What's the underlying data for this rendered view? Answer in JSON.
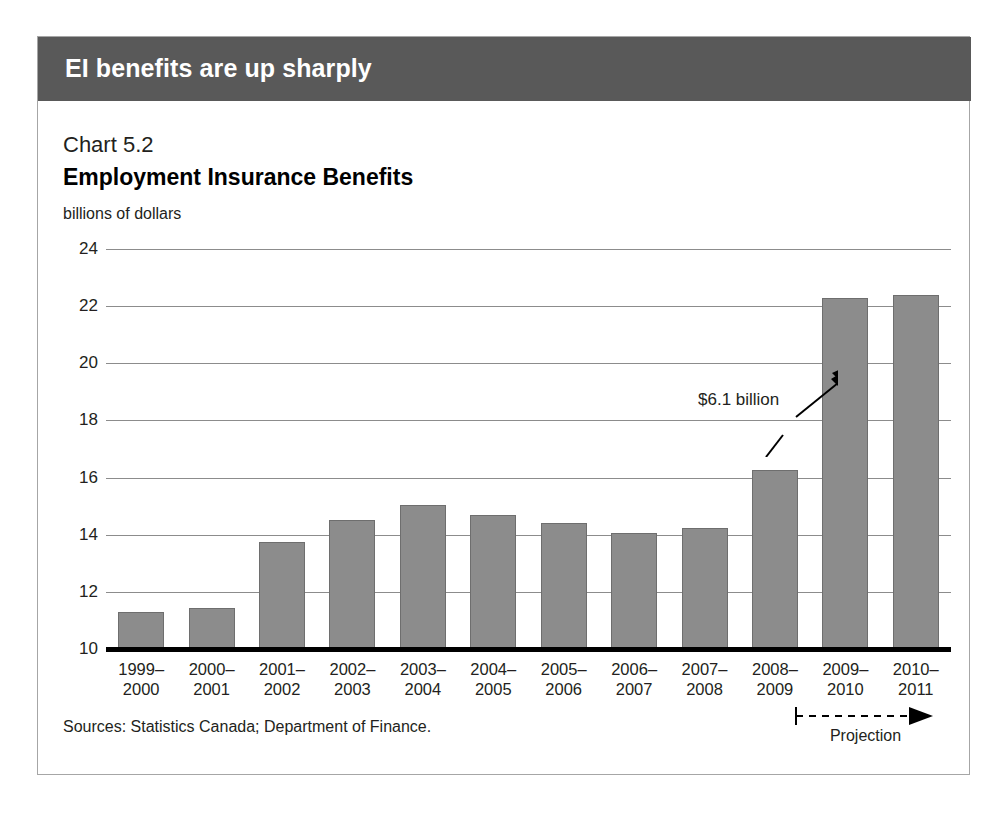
{
  "banner": {
    "title": "EI benefits are up sharply"
  },
  "figure": {
    "chart_number": "Chart 5.2",
    "title": "Employment Insurance Benefits",
    "unit_label": "billions of dollars",
    "sources": "Sources: Statistics Canada; Department of Finance.",
    "projection_label": "Projection",
    "annotation": "$6.1 billion"
  },
  "colors": {
    "banner_background": "#595959",
    "bar_fill": "#8c8c8c",
    "bar_outline": "#6e6e6e",
    "gridline": "#8c8c8c",
    "baseline": "#000000",
    "frame_border": "#a6a6a6",
    "text": "#231f20"
  },
  "chart_data": {
    "type": "bar",
    "title": "Employment Insurance Benefits",
    "subtitle": "Chart 5.2",
    "xlabel": "",
    "ylabel": "billions of dollars",
    "ylim": [
      10,
      24
    ],
    "yticks": [
      10,
      12,
      14,
      16,
      18,
      20,
      22,
      24
    ],
    "ytick_labels": [
      "10",
      "12",
      "14",
      "16",
      "18",
      "20",
      "22",
      "24"
    ],
    "grid": true,
    "legend": "none",
    "categories": [
      "1999–\n2000",
      "2000–\n2001",
      "2001–\n2002",
      "2002–\n2003",
      "2003–\n2004",
      "2004–\n2005",
      "2005–\n2006",
      "2006–\n2007",
      "2007–\n2008",
      "2008–\n2009",
      "2009–\n2010",
      "2010–\n2011"
    ],
    "category_lines": [
      [
        "1999–",
        "2000"
      ],
      [
        "2000–",
        "2001"
      ],
      [
        "2001–",
        "2002"
      ],
      [
        "2002–",
        "2003"
      ],
      [
        "2003–",
        "2004"
      ],
      [
        "2004–",
        "2005"
      ],
      [
        "2005–",
        "2006"
      ],
      [
        "2006–",
        "2007"
      ],
      [
        "2007–",
        "2008"
      ],
      [
        "2008–",
        "2009"
      ],
      [
        "2009–",
        "2010"
      ],
      [
        "2010–",
        "2011"
      ]
    ],
    "values": [
      11.3,
      11.45,
      13.75,
      14.5,
      15.05,
      14.7,
      14.4,
      14.05,
      14.25,
      16.25,
      22.3,
      22.4
    ],
    "annotations": [
      {
        "text": "$6.1 billion",
        "description": "double-headed arrow spanning the increase between 2008-2009 and 2009-2010"
      },
      {
        "text": "Projection",
        "description": "dashed arrow marking 2009-2010 and 2010-2011 as projected"
      }
    ]
  }
}
